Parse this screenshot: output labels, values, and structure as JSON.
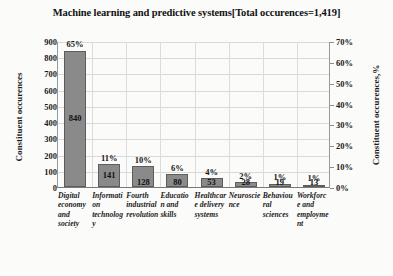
{
  "chart_data": {
    "type": "bar",
    "title": "Machine learning and predictive systems[Total occurences=1,419]",
    "categories": [
      "Digital economy and society",
      "Information technology",
      "Fourth industrial revolution",
      "Education and skills",
      "Healthcare delivery systems",
      "Neuroscience",
      "Behavioural sciences",
      "Workforce and employment"
    ],
    "values": [
      840,
      141,
      128,
      80,
      53,
      28,
      19,
      13
    ],
    "percent_labels": [
      "65%",
      "11%",
      "10%",
      "6%",
      "4%",
      "2%",
      "1%",
      "1%"
    ],
    "value_labels": [
      "840",
      "141",
      "128",
      "80",
      "53",
      "28",
      "19",
      "13"
    ],
    "xlabel": "",
    "ylabel": "Constituent occurences",
    "y2label": "Constituent occurences,%",
    "ylim": [
      0,
      900
    ],
    "y2lim": [
      0,
      70
    ],
    "yticks": [
      0,
      100,
      200,
      300,
      400,
      500,
      600,
      700,
      800,
      900
    ],
    "ytick_labels": [
      "0",
      "100",
      "200",
      "300",
      "400",
      "500",
      "600",
      "700",
      "800",
      "900"
    ],
    "y2ticks": [
      0,
      10,
      20,
      30,
      40,
      50,
      60,
      70
    ],
    "y2tick_labels": [
      "0%",
      "10%",
      "20%",
      "30%",
      "40%",
      "50%",
      "60%",
      "70%"
    ],
    "grid": true,
    "legend": false,
    "bar_color": "#8a8a8a",
    "bar_edge_color": "#5d5d5d",
    "grid_color": "#d9d9d9",
    "total_occurences": "1,419"
  }
}
